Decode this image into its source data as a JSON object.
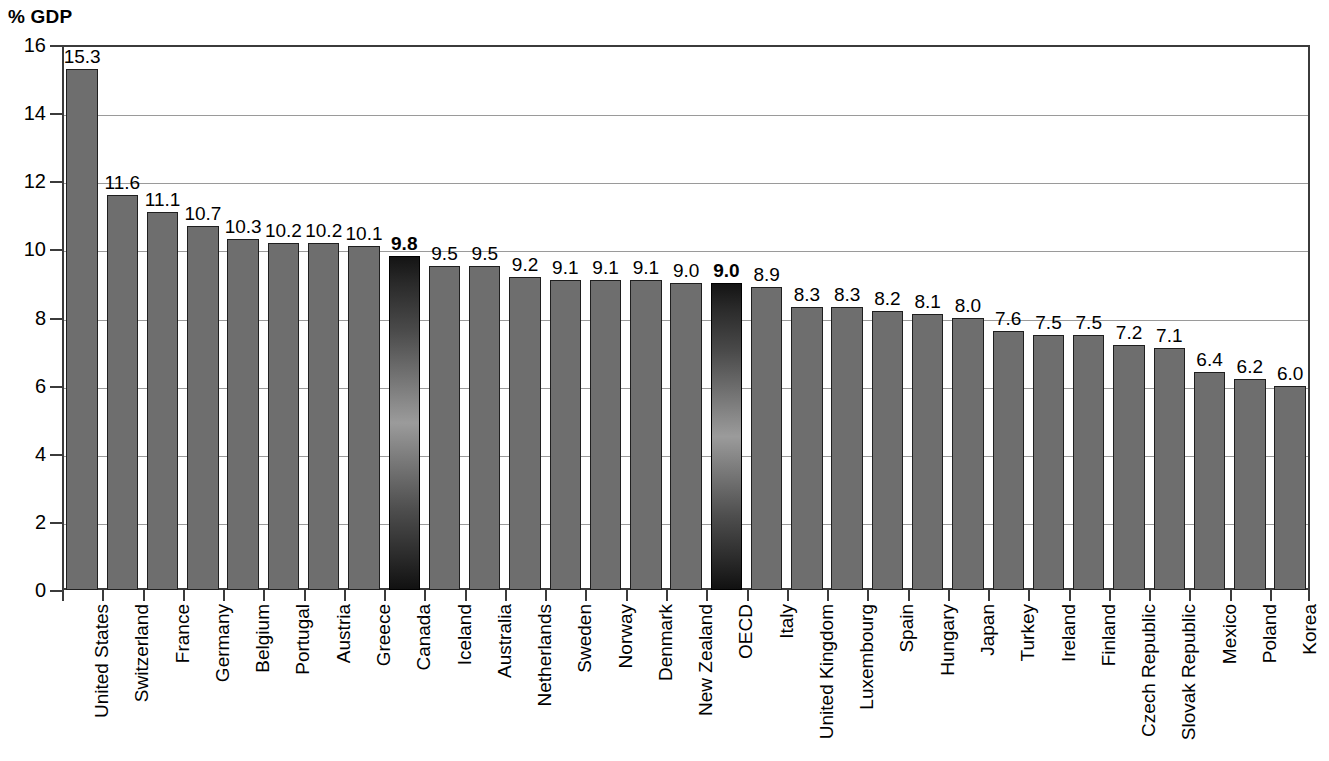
{
  "chart_data": {
    "type": "bar",
    "title": "",
    "ylabel": "% GDP",
    "xlabel": "",
    "ylim": [
      0,
      16
    ],
    "ytick_step": 2,
    "yticks": [
      "16",
      "14",
      "12",
      "10",
      "8",
      "6",
      "4",
      "2",
      "0"
    ],
    "grid": true,
    "legend": "none",
    "categories": [
      "United States",
      "Switzerland",
      "France",
      "Germany",
      "Belgium",
      "Portugal",
      "Austria",
      "Greece",
      "Canada",
      "Iceland",
      "Australia",
      "Netherlands",
      "Sweden",
      "Norway",
      "Denmark",
      "New Zealand",
      "OECD",
      "Italy",
      "United Kingdom",
      "Luxembourg",
      "Spain",
      "Hungary",
      "Japan",
      "Turkey",
      "Ireland",
      "Finland",
      "Czech Republic",
      "Slovak Republic",
      "Mexico",
      "Poland",
      "Korea"
    ],
    "values": [
      15.3,
      11.6,
      11.1,
      10.7,
      10.3,
      10.2,
      10.2,
      10.1,
      9.8,
      9.5,
      9.5,
      9.2,
      9.1,
      9.1,
      9.1,
      9.0,
      9.0,
      8.9,
      8.3,
      8.3,
      8.2,
      8.1,
      8.0,
      7.6,
      7.5,
      7.5,
      7.2,
      7.1,
      6.4,
      6.2,
      6.0
    ],
    "value_labels": [
      "15.3",
      "11.6",
      "11.1",
      "10.7",
      "10.3",
      "10.2",
      "10.2",
      "10.1",
      "9.8",
      "9.5",
      "9.5",
      "9.2",
      "9.1",
      "9.1",
      "9.1",
      "9.0",
      "9.0",
      "8.9",
      "8.3",
      "8.3",
      "8.2",
      "8.1",
      "8.0",
      "7.6",
      "7.5",
      "7.5",
      "7.2",
      "7.1",
      "6.4",
      "6.2",
      "6.0"
    ],
    "highlighted_categories": [
      "Canada",
      "OECD"
    ],
    "colors": {
      "bar": "#6e6e6e",
      "bar_border": "#1f1f1f",
      "highlight_dark": "#141414",
      "highlight_light": "#9b9b9b",
      "gridline": "#9a9a9a",
      "axis": "#3b3b3b",
      "text": "#000000",
      "background": "#ffffff"
    }
  }
}
